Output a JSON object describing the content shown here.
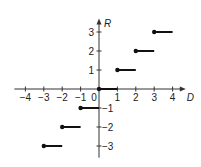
{
  "chart_data": {
    "type": "line",
    "title": "",
    "xlabel": "D",
    "ylabel": "R",
    "xlim": [
      -4.6,
      4.5
    ],
    "ylim": [
      -3.3,
      3.5
    ],
    "grid": false,
    "x_ticks": [
      -4,
      -3,
      -2,
      -1,
      0,
      1,
      2,
      3,
      4
    ],
    "x_tick_labels": [
      "−4",
      "−3",
      "−2",
      "−1",
      "0",
      "1",
      "2",
      "3",
      "4"
    ],
    "y_ticks": [
      -3,
      -2,
      -1,
      1,
      2,
      3
    ],
    "y_tick_labels": [
      "−3",
      "−2",
      "−1",
      "1",
      "2",
      "3"
    ],
    "series": [
      {
        "name": "step",
        "segments": [
          {
            "x_start": -3,
            "x_end": -2,
            "y": -3
          },
          {
            "x_start": -2,
            "x_end": -1,
            "y": -2
          },
          {
            "x_start": -1,
            "x_end": 0,
            "y": -1
          },
          {
            "x_start": 0,
            "x_end": 1,
            "y": 0
          },
          {
            "x_start": 1,
            "x_end": 2,
            "y": 1
          },
          {
            "x_start": 2,
            "x_end": 3,
            "y": 2
          },
          {
            "x_start": 3,
            "x_end": 4,
            "y": 3
          }
        ],
        "closed_endpoint": "left"
      }
    ]
  }
}
